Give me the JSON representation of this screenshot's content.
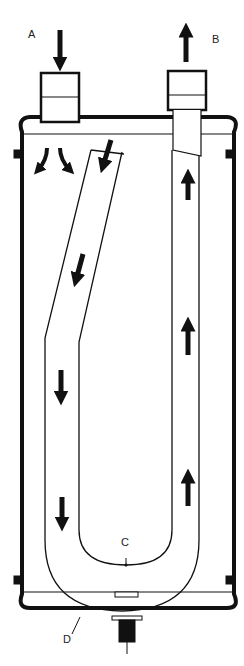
{
  "diagram": {
    "type": "u-tube heat exchanger / accumulator cross-section",
    "labels": {
      "inlet": "A",
      "outlet": "B",
      "bleed_hole": "C",
      "housing": "D"
    },
    "colors": {
      "line": "#111111",
      "background": "#ffffff",
      "label": "#222222"
    },
    "flow_arrows": {
      "inlet_down": 1,
      "deflect_inside": 2,
      "tube_descending": 4,
      "tube_ascending": 4,
      "outlet_up": 1
    }
  }
}
